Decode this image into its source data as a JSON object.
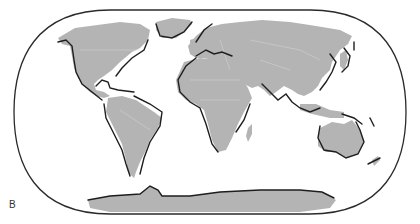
{
  "figure": {
    "panel_label": "B"
  },
  "colors": {
    "land": "#b4b4b4",
    "border": "#d6d6d6",
    "outline": "#1e1e1e",
    "frame": "#2a2a2a",
    "background": "#ffffff"
  }
}
